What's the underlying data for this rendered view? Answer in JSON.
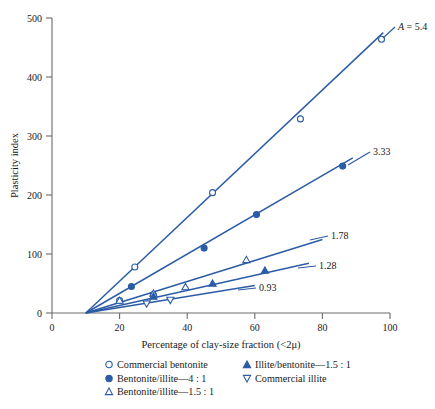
{
  "chart_data": {
    "type": "line",
    "title": "",
    "xlabel": "Percentage of clay-size fraction (<2μ)",
    "ylabel": "Plasticity index",
    "xlim": [
      0,
      100
    ],
    "ylim": [
      0,
      500
    ],
    "xticks": [
      0,
      20,
      40,
      60,
      80,
      100
    ],
    "yticks": [
      0,
      100,
      200,
      300,
      400,
      500
    ],
    "xticklabels": [
      "0",
      "20",
      "40",
      "60",
      "80",
      "100"
    ],
    "yticklabels": [
      "0",
      "100",
      "200",
      "300",
      "400",
      "500"
    ],
    "grid": false,
    "legend_position": "below-axes",
    "line_color": "#2b5ca5",
    "marker_color": "#2b5ca5",
    "axis_color": "#6b6b6b",
    "common_intercept_x": 10,
    "series": [
      {
        "name": "Commercial bentonite",
        "slope_label": "A = 5.4",
        "slope": 5.4,
        "marker": "open-circle",
        "line_end_x": 98,
        "points": [
          [
            20,
            21
          ],
          [
            24.5,
            78
          ],
          [
            47.5,
            204
          ],
          [
            73.5,
            329
          ],
          [
            97.5,
            464
          ]
        ]
      },
      {
        "name": "Bentonite/illite—4 : 1",
        "slope_label": "3.33",
        "slope": 3.33,
        "marker": "filled-circle",
        "line_end_x": 89,
        "points": [
          [
            23.5,
            45
          ],
          [
            30,
            31
          ],
          [
            45,
            110
          ],
          [
            60.5,
            167
          ],
          [
            86,
            249
          ]
        ]
      },
      {
        "name": "Bentonite/illite—1.5 : 1",
        "slope_label": "1.78",
        "slope": 1.78,
        "marker": "open-triangle-up",
        "line_end_x": 80,
        "points": [
          [
            20,
            21
          ],
          [
            30,
            33
          ],
          [
            39.5,
            44
          ],
          [
            57.5,
            90
          ]
        ]
      },
      {
        "name": "Illite/bentonite—1.5 : 1",
        "slope_label": "1.28",
        "slope": 1.28,
        "marker": "filled-triangle-up",
        "line_end_x": 76,
        "points": [
          [
            30,
            28
          ],
          [
            47.5,
            50
          ],
          [
            63,
            72
          ]
        ]
      },
      {
        "name": "Commercial illite",
        "slope_label": "0.93",
        "slope": 0.93,
        "marker": "open-triangle-down",
        "line_end_x": 60,
        "points": [
          [
            28,
            16
          ],
          [
            35,
            22
          ]
        ]
      }
    ]
  },
  "axes": {
    "y_title": "Plasticity index",
    "x_title": "Percentage of clay-size fraction (<2μ)",
    "x_tick_0": "0",
    "x_tick_20": "20",
    "x_tick_40": "40",
    "x_tick_60": "60",
    "x_tick_80": "80",
    "x_tick_100": "100",
    "y_tick_0": "0",
    "y_tick_100": "100",
    "y_tick_200": "200",
    "y_tick_300": "300",
    "y_tick_400": "400",
    "y_tick_500": "500"
  },
  "annotations": {
    "label_A_prefix": "A",
    "label_A_value": " = 5.4",
    "label_333": "3.33",
    "label_178": "1.78",
    "label_128": "1.28",
    "label_093": "0.93"
  },
  "legend": {
    "left": [
      {
        "marker": "open-circle",
        "label": "Commercial bentonite"
      },
      {
        "marker": "filled-circle",
        "label": "Bentonite/illite—4 : 1"
      },
      {
        "marker": "open-triangle-up",
        "label": "Bentonite/illite—1.5 : 1"
      }
    ],
    "right": [
      {
        "marker": "filled-triangle-up",
        "label": "Illite/bentonite—1.5 : 1"
      },
      {
        "marker": "open-triangle-down",
        "label": "Commercial illite"
      }
    ]
  }
}
